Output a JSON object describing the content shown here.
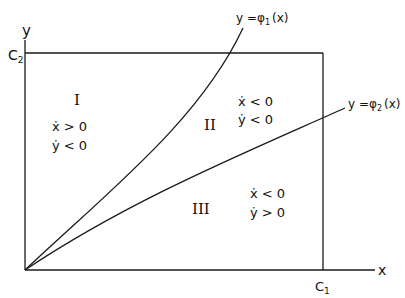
{
  "diagram": {
    "type": "phase-plane regions",
    "axes": {
      "x_label": "x",
      "y_label": "y"
    },
    "bounds": {
      "x_bound_label": "C",
      "x_bound_sub": "1",
      "y_bound_label": "C",
      "y_bound_sub": "2"
    },
    "curves": [
      {
        "id": "phi1",
        "label_prefix": "y =",
        "symbol": "φ",
        "sub": "1",
        "suffix": "(x)"
      },
      {
        "id": "phi2",
        "label_prefix": "y =",
        "symbol": "φ",
        "sub": "2",
        "suffix": "(x)"
      }
    ],
    "regions": [
      {
        "numeral": "I",
        "line1": "ẋ > 0",
        "line2": "ẏ < 0"
      },
      {
        "numeral": "II",
        "line1": "ẋ < 0",
        "line2": "ẏ < 0"
      },
      {
        "numeral": "III",
        "line1": "ẋ < 0",
        "line2": "ẏ > 0"
      }
    ]
  }
}
